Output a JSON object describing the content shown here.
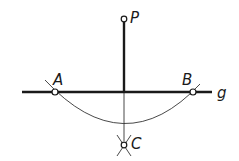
{
  "diagram": {
    "points": {
      "P": {
        "label": "P",
        "x": 124,
        "y": 19
      },
      "A": {
        "label": "A",
        "x": 55,
        "y": 92
      },
      "B": {
        "label": "B",
        "x": 193,
        "y": 92
      },
      "C": {
        "label": "C",
        "x": 124,
        "y": 145
      }
    },
    "line": {
      "label": "g"
    },
    "colors": {
      "stroke": "#1a1a1a",
      "background": "#ffffff"
    }
  }
}
